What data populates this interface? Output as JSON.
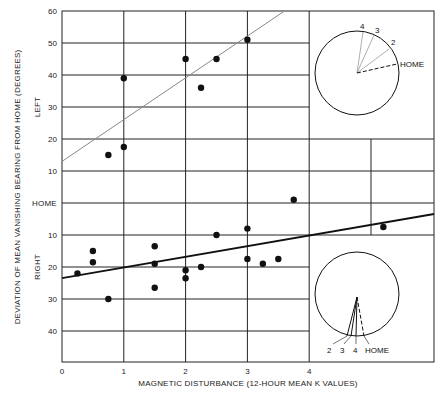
{
  "chart_data": {
    "type": "scatter",
    "title": "",
    "xlabel": "MAGNETIC DISTURBANCE (12-HOUR MEAN K VALUES)",
    "ylabel": "DEVIATION OF MEAN VANISHING BEARING FROM HOME (DEGREES)",
    "x_ticks": [
      "0",
      "1",
      "2",
      "3",
      "4"
    ],
    "y_ticks_left": [
      "60",
      "50",
      "40",
      "30",
      "20",
      "10"
    ],
    "y_center_label": "HOME",
    "y_ticks_right": [
      "10",
      "20",
      "30",
      "40"
    ],
    "region_labels": {
      "upper": "LEFT",
      "lower": "RIGHT"
    },
    "xlim": [
      0,
      6
    ],
    "ylim_note": "positive = LEFT of home (up to 60), negative = RIGHT of home (down to ~-49)",
    "grid": true,
    "series": [
      {
        "name": "Left-deviating birds",
        "points": [
          {
            "x": 0.75,
            "y": 15
          },
          {
            "x": 1.0,
            "y": 17.5
          },
          {
            "x": 1.0,
            "y": 39
          },
          {
            "x": 2.0,
            "y": 45
          },
          {
            "x": 2.25,
            "y": 36
          },
          {
            "x": 2.5,
            "y": 45
          },
          {
            "x": 3.0,
            "y": 51
          }
        ],
        "regression": {
          "x0": 0,
          "y0": 13,
          "x1": 3.6,
          "y1": 60,
          "style": "thin gray"
        }
      },
      {
        "name": "Right-deviating birds",
        "points": [
          {
            "x": 0.25,
            "y": -22
          },
          {
            "x": 0.5,
            "y": -15
          },
          {
            "x": 0.5,
            "y": -18.5
          },
          {
            "x": 0.75,
            "y": -30
          },
          {
            "x": 1.5,
            "y": -13.5
          },
          {
            "x": 1.5,
            "y": -19
          },
          {
            "x": 1.5,
            "y": -26.5
          },
          {
            "x": 2.0,
            "y": -21
          },
          {
            "x": 2.0,
            "y": -23.5
          },
          {
            "x": 2.25,
            "y": -20
          },
          {
            "x": 2.5,
            "y": -10
          },
          {
            "x": 3.0,
            "y": -8
          },
          {
            "x": 3.0,
            "y": -17.5
          },
          {
            "x": 3.25,
            "y": -19
          },
          {
            "x": 3.5,
            "y": -17.5
          },
          {
            "x": 3.75,
            "y": 1
          },
          {
            "x": 5.2,
            "y": -7.5
          }
        ],
        "regression": {
          "x0": 0,
          "y0": -23.5,
          "x1": 6,
          "y1": -3.5,
          "style": "thick black"
        }
      }
    ],
    "insets": [
      {
        "name": "upper-inset-vanishing-bearings",
        "labels": [
          "4",
          "3",
          "2",
          "HOME"
        ],
        "home_line": "dashed"
      },
      {
        "name": "lower-inset-vanishing-bearings",
        "labels": [
          "2",
          "3",
          "4",
          "HOME"
        ],
        "home_line": "dashed"
      }
    ]
  },
  "axes": {
    "xlabel": "MAGNETIC DISTURBANCE (12-HOUR MEAN K VALUES)",
    "ylabel": "DEVIATION OF MEAN VANISHING BEARING FROM HOME (DEGREES)",
    "left_label": "LEFT",
    "right_label": "RIGHT",
    "home_label": "HOME"
  },
  "insets": {
    "upper": {
      "l4": "4",
      "l3": "3",
      "l2": "2",
      "home": "HOME"
    },
    "lower": {
      "l2": "2",
      "l3": "3",
      "l4": "4",
      "home": "HOME"
    }
  }
}
